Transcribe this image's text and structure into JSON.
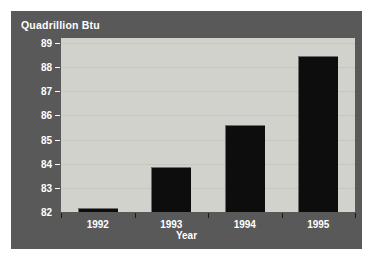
{
  "figure": {
    "title": "Quadrillion Btu",
    "background_color": "#595959",
    "plot_background_color": "#d2d2cd",
    "bar_color": "#0d0d0d",
    "text_color": "#ffffff"
  },
  "chart_data": {
    "type": "bar",
    "title": "Quadrillion Btu",
    "xlabel": "Year",
    "ylabel": "Quadrillion Btu",
    "categories": [
      "1992",
      "1993",
      "1994",
      "1995"
    ],
    "values": [
      82.15,
      83.85,
      85.6,
      88.45
    ],
    "ylim": [
      82,
      89.2
    ],
    "yticks": [
      82,
      83,
      84,
      85,
      86,
      87,
      88,
      89
    ],
    "ytick_labels": [
      "82",
      "83",
      "84",
      "85",
      "86",
      "87",
      "88",
      "89"
    ],
    "grid": true,
    "legend": null,
    "series": [
      {
        "name": "Quadrillion Btu",
        "values": [
          82.15,
          83.85,
          85.6,
          88.45
        ]
      }
    ]
  }
}
